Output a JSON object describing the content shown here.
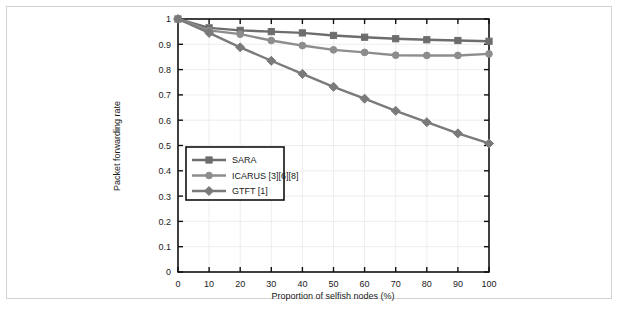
{
  "figure": {
    "background_color": "#ffffff",
    "frame_color": "#d2d2d2",
    "caption_fragment": ""
  },
  "chart_data": {
    "type": "line",
    "title": "",
    "xlabel": "Proportion of selfish nodes (%)",
    "ylabel": "Packet forwarding rate",
    "x": [
      0,
      10,
      20,
      30,
      40,
      50,
      60,
      70,
      80,
      90,
      100
    ],
    "xlim": [
      0,
      100
    ],
    "ylim": [
      0,
      1
    ],
    "xticks": [
      "0",
      "10",
      "20",
      "30",
      "40",
      "50",
      "60",
      "70",
      "80",
      "90",
      "100"
    ],
    "yticks": [
      "0",
      "0.1",
      "0.2",
      "0.3",
      "0.4",
      "0.5",
      "0.6",
      "0.7",
      "0.8",
      "0.9",
      "1"
    ],
    "ytick_values": [
      0,
      0.1,
      0.2,
      0.3,
      0.4,
      0.5,
      0.6,
      0.7,
      0.8,
      0.9,
      1
    ],
    "grid": true,
    "grid_color": "#e8e8e8",
    "legend_position": "center-left",
    "series": [
      {
        "name": "SARA",
        "marker": "square",
        "color": "#6d6d6d",
        "values": [
          1.0,
          0.965,
          0.955,
          0.95,
          0.945,
          0.935,
          0.928,
          0.922,
          0.918,
          0.915,
          0.912
        ]
      },
      {
        "name": "ICARUS [3][6][8]",
        "marker": "circle",
        "color": "#8d8d8d",
        "values": [
          1.0,
          0.955,
          0.94,
          0.915,
          0.895,
          0.878,
          0.868,
          0.857,
          0.856,
          0.856,
          0.862
        ]
      },
      {
        "name": "GTFT [1]",
        "marker": "diamond",
        "color": "#7a7a7a",
        "values": [
          1.0,
          0.945,
          0.888,
          0.835,
          0.783,
          0.732,
          0.685,
          0.637,
          0.592,
          0.548,
          0.508
        ]
      }
    ]
  },
  "legend": {
    "entries": [
      {
        "label": "SARA"
      },
      {
        "label": "ICARUS [3][6][8]"
      },
      {
        "label": "GTFT [1]"
      }
    ]
  }
}
